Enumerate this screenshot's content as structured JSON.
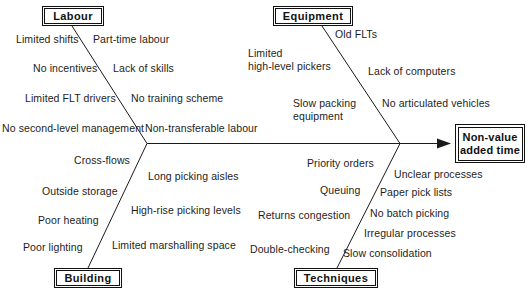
{
  "diagram": {
    "type": "fishbone-ishikawa",
    "effect": {
      "line1": "Non-value",
      "line2": "added time"
    },
    "categories": [
      {
        "name": "Labour",
        "label": "Labour",
        "position": "top-left",
        "causes_left": [
          "Limited shifts",
          "No incentives",
          "Limited FLT drivers",
          "No second-level management"
        ],
        "causes_right": [
          "Part-time labour",
          "Lack of skills",
          "No training scheme",
          "Non-transferable labour"
        ]
      },
      {
        "name": "Equipment",
        "label": "Equipment",
        "position": "top-right",
        "causes_left": [
          "Limited",
          "high-level pickers",
          "Slow packing",
          "equipment"
        ],
        "causes_right": [
          "Old FLTs",
          "Lack of computers",
          "No articulated vehicles"
        ]
      },
      {
        "name": "Building",
        "label": "Building",
        "position": "bottom-left",
        "causes_left": [
          "Cross-flows",
          "Outside storage",
          "Poor heating",
          "Poor lighting"
        ],
        "causes_right": [
          "Long picking aisles",
          "High-rise picking levels",
          "Limited marshalling space"
        ]
      },
      {
        "name": "Techniques",
        "label": "Techniques",
        "position": "bottom-right",
        "causes_left": [
          "Priority orders",
          "Queuing",
          "Returns congestion",
          "Double-checking"
        ],
        "causes_right": [
          "Unclear processes",
          "Paper pick lists",
          "No batch picking",
          "Irregular processes",
          "Slow consolidation"
        ]
      }
    ]
  },
  "labels": {
    "labour": {
      "limited_shifts": "Limited shifts",
      "part_time_labour": "Part-time labour",
      "no_incentives": "No incentives",
      "lack_of_skills": "Lack of skills",
      "limited_flt_drivers": "Limited FLT drivers",
      "no_training_scheme": "No training scheme",
      "no_second_level_management": "No second-level management",
      "non_transferable_labour": "Non-transferable labour"
    },
    "equipment": {
      "limited_high_level_pickers_l1": "Limited",
      "limited_high_level_pickers_l2": "high-level pickers",
      "old_flts": "Old FLTs",
      "lack_of_computers": "Lack of computers",
      "slow_packing_l1": "Slow packing",
      "slow_packing_l2": "equipment",
      "no_articulated_vehicles": "No articulated vehicles"
    },
    "building": {
      "cross_flows": "Cross-flows",
      "long_picking_aisles": "Long picking aisles",
      "outside_storage": "Outside storage",
      "high_rise_picking_levels": "High-rise picking levels",
      "poor_heating": "Poor heating",
      "poor_lighting": "Poor lighting",
      "limited_marshalling_space": "Limited marshalling space"
    },
    "techniques": {
      "priority_orders": "Priority orders",
      "unclear_processes": "Unclear processes",
      "queuing": "Queuing",
      "paper_pick_lists": "Paper pick lists",
      "returns_congestion": "Returns congestion",
      "no_batch_picking": "No batch picking",
      "double_checking": "Double-checking",
      "irregular_processes": "Irregular processes",
      "slow_consolidation": "Slow consolidation"
    },
    "boxes": {
      "labour": "Labour",
      "equipment": "Equipment",
      "building": "Building",
      "techniques": "Techniques"
    }
  },
  "colors": {
    "line": "#1a1a1a",
    "text": "#1d1d1d",
    "background": "#ffffff"
  }
}
